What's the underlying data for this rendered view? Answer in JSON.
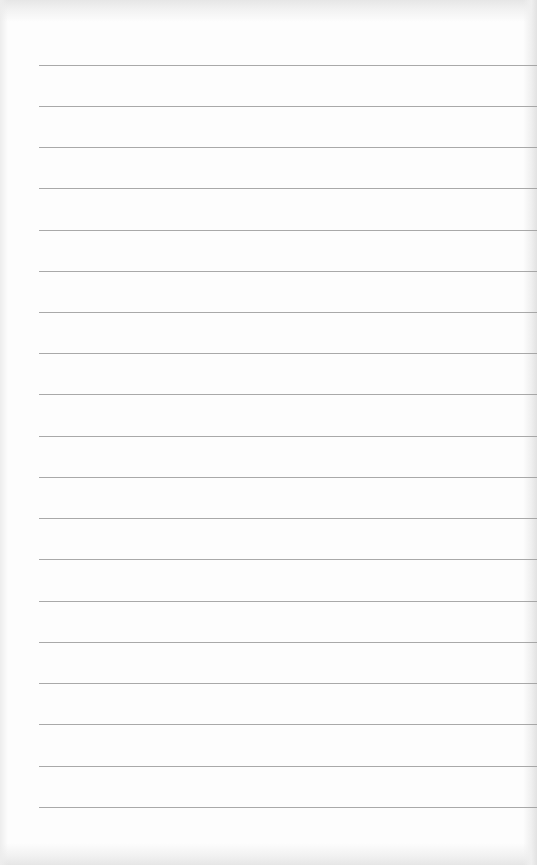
{
  "page": {
    "type": "lined-paper",
    "background_color": "#fdfdfd",
    "line_color": "#9a9a9a",
    "line_count": 19,
    "line_start_x": 39,
    "line_positions_y": [
      65,
      106,
      147,
      188,
      230,
      271,
      312,
      353,
      394,
      436,
      477,
      518,
      559,
      601,
      642,
      683,
      724,
      766,
      807
    ]
  }
}
